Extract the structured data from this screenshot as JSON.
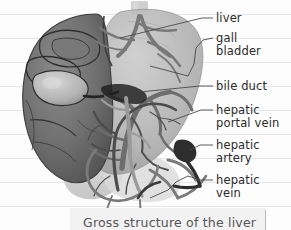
{
  "figure": {
    "title": "Gross structure of the liver",
    "labels": [
      {
        "id": "liver",
        "lines": [
          "liver"
        ],
        "x": 216,
        "y": 12
      },
      {
        "id": "gall-bladder",
        "lines": [
          "gall",
          "bladder"
        ],
        "x": 216,
        "y": 32
      },
      {
        "id": "bile-duct",
        "lines": [
          "bile duct"
        ],
        "x": 216,
        "y": 80
      },
      {
        "id": "hepatic-portal-vein",
        "lines": [
          "hepatic",
          "portal vein"
        ],
        "x": 216,
        "y": 104
      },
      {
        "id": "hepatic-artery",
        "lines": [
          "hepatic",
          "artery"
        ],
        "x": 216,
        "y": 139
      },
      {
        "id": "hepatic-vein",
        "lines": [
          "hepatic",
          "vein"
        ],
        "x": 216,
        "y": 174
      }
    ]
  },
  "caption": {
    "text": "Gross structure of the liver"
  },
  "colors": {
    "page_background": "#fdfdfd",
    "rule_line": "#e6e7ea",
    "label_text": "#2b2b2b",
    "caption_background": "#f2f2f2",
    "caption_text": "#555557",
    "caption_border": "#b9b9b9",
    "leader_line": "#4a4a4a",
    "liver_left_lobe_dark": "#6e6e6e",
    "liver_right_lobe_light": "#b6b6b6",
    "vessel_mid": "#8a8a8a",
    "vessel_dark": "#3c3c3c",
    "gall_bladder_light": "#c9c9c9",
    "vena_cava_stub": "#cfcfcf"
  },
  "rules": {
    "count": 10,
    "spacing": 24,
    "first_y": 14
  }
}
